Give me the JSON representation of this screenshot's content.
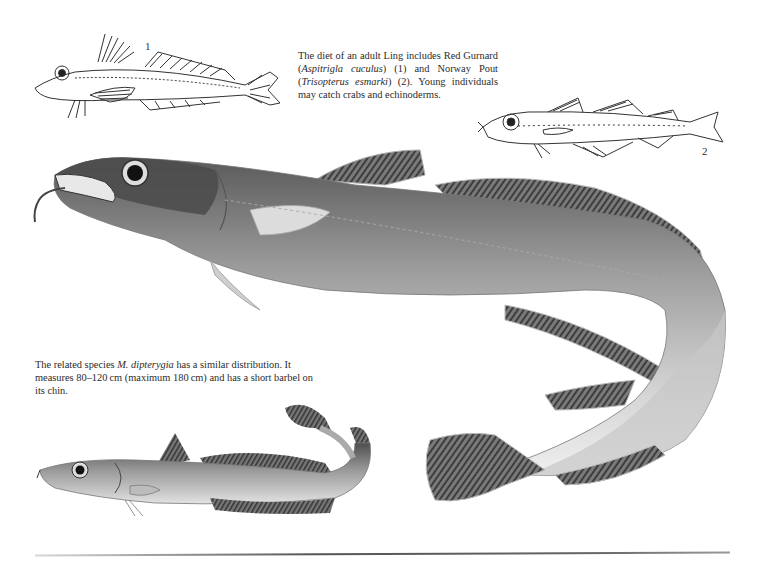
{
  "page": {
    "captions": {
      "diet": {
        "parts": [
          {
            "text": "The diet of an adult Ling includes Red Gurnard (",
            "italic": false
          },
          {
            "text": "Aspitrigla cuculus",
            "italic": true
          },
          {
            "text": ") (1) and Norway Pout (",
            "italic": false
          },
          {
            "text": "Trisopterus esmarki",
            "italic": true
          },
          {
            "text": ") (2). Young individuals may catch crabs and echinoderms.",
            "italic": false
          }
        ]
      },
      "related": {
        "parts": [
          {
            "text": "The related species ",
            "italic": false
          },
          {
            "text": "M. dipterygia",
            "italic": true
          },
          {
            "text": " has a similar distribution. It measures 80–120 cm (maximum 180 cm) and has a short barbel on its chin.",
            "italic": false
          }
        ]
      }
    },
    "figure_labels": {
      "one": "1",
      "two": "2"
    },
    "illustrations": [
      {
        "id": "red-gurnard",
        "label": "1",
        "style": "line drawing"
      },
      {
        "id": "norway-pout",
        "label": "2",
        "style": "line drawing"
      },
      {
        "id": "ling",
        "style": "grayscale painting"
      },
      {
        "id": "blue-ling",
        "style": "grayscale painting"
      }
    ],
    "colors": {
      "background": "#ffffff",
      "text": "#2b2b2b",
      "ink": "#3a3a3a",
      "fish_dark": "#4a4a4a",
      "fish_mid": "#8d8d8d",
      "fish_light": "#d9d9d9"
    }
  }
}
